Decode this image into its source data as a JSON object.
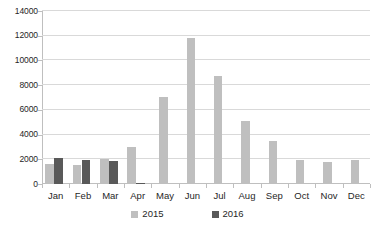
{
  "chart_data": {
    "type": "bar",
    "title": "",
    "subtitle": "",
    "xlabel": "",
    "ylabel": "",
    "categories": [
      "Jan",
      "Feb",
      "Mar",
      "Apr",
      "May",
      "Jun",
      "Jul",
      "Aug",
      "Sep",
      "Oct",
      "Nov",
      "Dec"
    ],
    "series": [
      {
        "name": "2015",
        "color": "#bfbfbf",
        "values": [
          1650,
          1500,
          2050,
          3000,
          7030,
          11850,
          8750,
          5100,
          3500,
          1950,
          1800,
          1950
        ]
      },
      {
        "name": "2016",
        "color": "#595959",
        "values": [
          2100,
          1980,
          1900,
          100,
          null,
          null,
          null,
          null,
          null,
          null,
          null,
          null
        ]
      }
    ],
    "ylim": [
      0,
      14000
    ],
    "ytick_step": 2000,
    "yticks": [
      0,
      2000,
      4000,
      6000,
      8000,
      10000,
      12000,
      14000
    ],
    "ytick_labels": [
      "0",
      "2000",
      "4000",
      "6000",
      "8000",
      "10000",
      "12000",
      "14000"
    ],
    "grid": true,
    "grid_axis": "y",
    "legend": [
      "2015",
      "2016"
    ],
    "legend_position": "bottom",
    "annotations": []
  },
  "legend": {
    "items": [
      {
        "label": "2015",
        "swatch_name": "legend-swatch-2015"
      },
      {
        "label": "2016",
        "swatch_name": "legend-swatch-2016"
      }
    ]
  }
}
